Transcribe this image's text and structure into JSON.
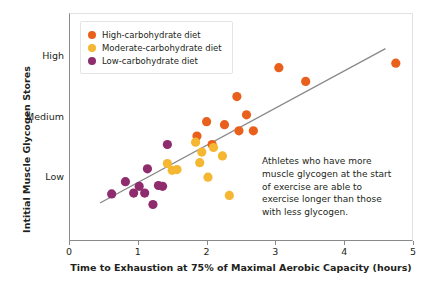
{
  "chart_data": {
    "type": "scatter",
    "title": "",
    "xlabel": "Time to Exhaustion at 75% of Maximal Aerobic Capacity (hours)",
    "ylabel": "Intitial Muscle Glycogen Stores",
    "xlim": [
      0,
      5
    ],
    "ylim": [
      0,
      3
    ],
    "grid": false,
    "legend_position": "top-left",
    "xticks": [
      "0",
      "1",
      "2",
      "3",
      "4",
      "5"
    ],
    "xtick_values": [
      0,
      1,
      2,
      3,
      4,
      5
    ],
    "yticks": [
      "Low",
      "Medium",
      "High"
    ],
    "ytick_values": [
      0.85,
      1.65,
      2.45
    ],
    "series": [
      {
        "name": "High-carbohydrate diet",
        "color": "#E8601C",
        "points": [
          [
            1.86,
            1.38
          ],
          [
            2.0,
            1.57
          ],
          [
            2.08,
            1.27
          ],
          [
            2.26,
            1.53
          ],
          [
            2.44,
            1.9
          ],
          [
            2.47,
            1.45
          ],
          [
            2.58,
            1.66
          ],
          [
            2.68,
            1.45
          ],
          [
            3.05,
            2.28
          ],
          [
            3.44,
            2.1
          ],
          [
            4.75,
            2.34
          ]
        ]
      },
      {
        "name": "Moderate-carbohydrate diet",
        "color": "#F5B731",
        "points": [
          [
            1.43,
            1.02
          ],
          [
            1.5,
            0.93
          ],
          [
            1.57,
            0.94
          ],
          [
            1.84,
            1.3
          ],
          [
            1.9,
            1.03
          ],
          [
            1.93,
            1.17
          ],
          [
            2.02,
            0.84
          ],
          [
            2.1,
            1.23
          ],
          [
            2.23,
            1.12
          ],
          [
            2.33,
            0.6
          ]
        ]
      },
      {
        "name": "Low-carbohydrate diet",
        "color": "#8E2C6E",
        "points": [
          [
            0.62,
            0.62
          ],
          [
            0.82,
            0.78
          ],
          [
            0.94,
            0.63
          ],
          [
            1.02,
            0.72
          ],
          [
            1.1,
            0.63
          ],
          [
            1.14,
            0.95
          ],
          [
            1.22,
            0.48
          ],
          [
            1.3,
            0.73
          ],
          [
            1.36,
            0.72
          ],
          [
            1.43,
            1.27
          ]
        ]
      }
    ],
    "trendline": {
      "name": "trend-line",
      "color": "#8a8a8a",
      "x0": 0.45,
      "y0": 0.5,
      "x1": 4.6,
      "y1": 2.53
    },
    "annotation": "Athletes who have more muscle glycogen at the start of exercise are able to exercise longer than those with less glycogen."
  },
  "legend": {
    "items": [
      {
        "label": "High-carbohydrate diet",
        "color": "#E8601C"
      },
      {
        "label": "Moderate-carbohydrate diet",
        "color": "#F5B731"
      },
      {
        "label": "Low-carbohydrate diet",
        "color": "#8E2C6E"
      }
    ]
  }
}
